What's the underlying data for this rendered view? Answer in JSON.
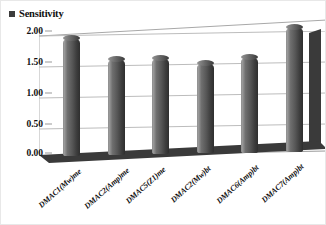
{
  "legend": {
    "marker_icon": "square-marker-icon",
    "label": "Sensitivity",
    "color": "#3c3c3c"
  },
  "chart_data": {
    "type": "bar",
    "title": "",
    "subtitle": "",
    "xlabel": "",
    "ylabel": "",
    "ylim": [
      0,
      2.0
    ],
    "ytick_step": 0.5,
    "grid": true,
    "legend_position": "top-left",
    "style": "3d-cylinder-column",
    "categories": [
      "DMAC1(Mw)me",
      "DMAC2(Amp)me",
      "DMAC5(Z1)me",
      "DMAC2(Mw)bt",
      "DMAC6(Amp)bt",
      "DMAC7(Amp)bt"
    ],
    "series": [
      {
        "name": "Sensitivity",
        "values": [
          1.88,
          1.53,
          1.53,
          1.44,
          1.53,
          2.0
        ],
        "color": "#565656"
      }
    ],
    "ytick_labels": [
      "0.00",
      "0.50",
      "1.00",
      "1.50",
      "2.00"
    ],
    "ytick_values": [
      0.0,
      0.5,
      1.0,
      1.5,
      2.0
    ]
  },
  "colors": {
    "bar_fill": "#565656",
    "floor": "#3a3a3a",
    "gridline": "#b6b6b6",
    "wall_edge": "#a8a8a8",
    "text": "#111111"
  }
}
